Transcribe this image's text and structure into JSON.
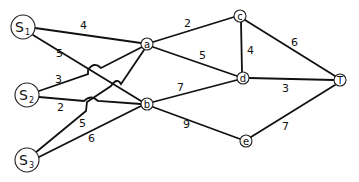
{
  "diagram": {
    "type": "network-flow-graph",
    "sources": [
      {
        "id": "S1",
        "letter": "S",
        "sub": "1"
      },
      {
        "id": "S2",
        "letter": "S",
        "sub": "2"
      },
      {
        "id": "S3",
        "letter": "S",
        "sub": "3"
      }
    ],
    "nodes": [
      {
        "id": "a",
        "label": "a"
      },
      {
        "id": "b",
        "label": "b"
      },
      {
        "id": "c",
        "label": "c"
      },
      {
        "id": "d",
        "label": "d"
      },
      {
        "id": "e",
        "label": "e"
      },
      {
        "id": "T",
        "label": "T"
      }
    ],
    "edges": [
      {
        "from": "S1",
        "to": "a",
        "weight": "4"
      },
      {
        "from": "S1",
        "to": "b",
        "weight": "5"
      },
      {
        "from": "S2",
        "to": "a",
        "weight": "3"
      },
      {
        "from": "S2",
        "to": "b",
        "weight": "2"
      },
      {
        "from": "S3",
        "to": "a",
        "weight": "5"
      },
      {
        "from": "S3",
        "to": "b",
        "weight": "6"
      },
      {
        "from": "a",
        "to": "c",
        "weight": "2"
      },
      {
        "from": "a",
        "to": "d",
        "weight": "5"
      },
      {
        "from": "c",
        "to": "d",
        "weight": "4"
      },
      {
        "from": "c",
        "to": "T",
        "weight": "6"
      },
      {
        "from": "d",
        "to": "T",
        "weight": "3"
      },
      {
        "from": "b",
        "to": "d",
        "weight": "7"
      },
      {
        "from": "b",
        "to": "e",
        "weight": "9"
      },
      {
        "from": "e",
        "to": "T",
        "weight": "7"
      }
    ]
  }
}
